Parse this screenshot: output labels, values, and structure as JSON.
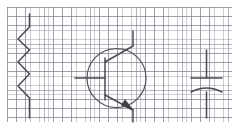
{
  "canvas": {
    "width": 239,
    "height": 127,
    "background_color": "#ffffff",
    "title": "Hand-drawn circuit symbols on graph paper"
  },
  "paper": {
    "name": "graph-paper",
    "x": 7,
    "y": 7,
    "width": 225,
    "height": 115,
    "paper_color": "#fefefe",
    "minor_grid_color": "#5a5f6e",
    "major_grid_color": "#787d8c",
    "minor_grid_spacing_px": 4.6,
    "major_grid_spacing_px": 9.2
  },
  "ink": {
    "stroke_color": "#4a4a52",
    "fill_color": "#3f3f47",
    "stroke_width": 1.5
  },
  "symbols": [
    {
      "id": "resistor",
      "label": "Resistor",
      "type": "zigzag-resistor",
      "orientation": "vertical",
      "terminals": 2,
      "zigzag_peaks": 5,
      "geometry": {
        "top_lead": {
          "x1": 29.5,
          "y1": 14,
          "x2": 29.5,
          "y2": 27
        },
        "zigzag_points": "29.5,27 18,39 29.5,50 18,62 29.5,74 18,86 29.5,98",
        "bottom_lead": {
          "x1": 29.5,
          "y1": 98,
          "x2": 29.5,
          "y2": 118
        }
      }
    },
    {
      "id": "transistor",
      "label": "NPN bipolar junction transistor",
      "type": "bjt-npn",
      "terminals": 3,
      "terminal_names": [
        "collector",
        "base",
        "emitter"
      ],
      "has_envelope_circle": true,
      "geometry": {
        "circle": {
          "cx": 116.5,
          "cy": 78,
          "r": 29.5
        },
        "base_bar": {
          "x1": 105,
          "y1": 58,
          "x2": 105,
          "y2": 100
        },
        "base_lead": {
          "x1": 75,
          "y1": 78,
          "x2": 105,
          "y2": 78
        },
        "collector_segment": {
          "x1": 105,
          "y1": 62,
          "x2": 133,
          "y2": 46
        },
        "collector_lead": {
          "x1": 133,
          "y1": 46,
          "x2": 133,
          "y2": 31
        },
        "emitter_segment": {
          "x1": 105,
          "y1": 95,
          "x2": 133,
          "y2": 110
        },
        "emitter_lead": {
          "x1": 133,
          "y1": 110,
          "x2": 133,
          "y2": 122
        },
        "arrow_head_points": "133,110 121.5,105.5 125,99.5"
      }
    },
    {
      "id": "capacitor",
      "label": "Polarized capacitor",
      "type": "capacitor-polarized",
      "terminals": 2,
      "geometry": {
        "top_lead": {
          "x1": 206.5,
          "y1": 50,
          "x2": 206.5,
          "y2": 78
        },
        "straight_plate": {
          "x1": 191,
          "y1": 78,
          "x2": 222,
          "y2": 78
        },
        "curved_plate_path": "M 191,92 Q 206.5,84 222,92",
        "bottom_lead": {
          "x1": 206.5,
          "y1": 92,
          "x2": 206.5,
          "y2": 118
        }
      }
    }
  ]
}
